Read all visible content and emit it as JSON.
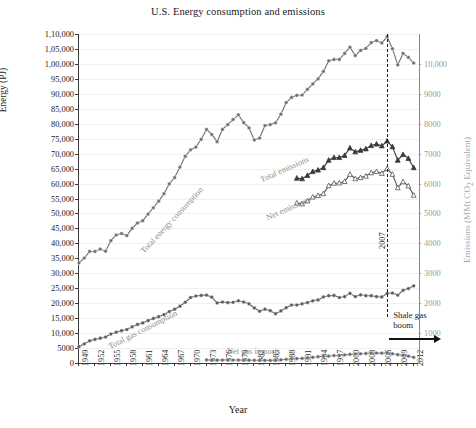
{
  "chart_data": {
    "type": "line",
    "title": "U.S. Energy consumption and emissions",
    "xlabel": "Year",
    "ylabel": "Energy (PJ)",
    "ylabel_right": "Emissions (MMt CO2 Equivalent)",
    "ylabel_right_parts": {
      "pre": "Emissions (MMt CO",
      "sub": "2",
      "post": " Equivalent)"
    },
    "xlim": [
      1949,
      2013
    ],
    "ylim": [
      0,
      110000
    ],
    "ylim_right": [
      0,
      11000
    ],
    "grid": true,
    "legend_position": "inline-annotations",
    "ytick_labels_left": [
      "0",
      "5000",
      "10,000",
      "15,000",
      "20,000",
      "25,000",
      "30,000",
      "35,000",
      "40,000",
      "45,000",
      "50,000",
      "55,000",
      "60,000",
      "65,000",
      "70,000",
      "75,000",
      "80,000",
      "85,000",
      "90,000",
      "95,000",
      "1,00,000",
      "1,05,000",
      "1,10,000"
    ],
    "ytick_values_left": [
      0,
      5000,
      10000,
      15000,
      20000,
      25000,
      30000,
      35000,
      40000,
      45000,
      50000,
      55000,
      60000,
      65000,
      70000,
      75000,
      80000,
      85000,
      90000,
      95000,
      100000,
      105000,
      110000
    ],
    "ytick_labels_right": [
      "1000",
      "2000",
      "3000",
      "4000",
      "5000",
      "6000",
      "7000",
      "8000",
      "9000",
      "10,000"
    ],
    "ytick_values_right": [
      1000,
      2000,
      3000,
      4000,
      5000,
      6000,
      7000,
      8000,
      9000,
      10000
    ],
    "xtick_labels": [
      "1949",
      "1952",
      "1955",
      "1958",
      "1961",
      "1964",
      "1967",
      "1970",
      "1973",
      "1976",
      "1979",
      "1982",
      "1985",
      "1988",
      "1991",
      "1994",
      "1997",
      "2000",
      "2003",
      "2006",
      "2009",
      "2012"
    ],
    "xtick_values": [
      1949,
      1952,
      1955,
      1958,
      1961,
      1964,
      1967,
      1970,
      1973,
      1976,
      1979,
      1982,
      1985,
      1988,
      1991,
      1994,
      1997,
      2000,
      2003,
      2006,
      2009,
      2012
    ],
    "annotations": [
      {
        "name": "event-line-2007",
        "label": "2007",
        "x": 2007,
        "style": "dashed-vertical"
      },
      {
        "name": "shale-gas-boom",
        "label_line1": "Shale gas",
        "label_line2": "boom",
        "x": 2007,
        "style": "arrow-right"
      }
    ],
    "series": [
      {
        "name": "Total energy consumption",
        "axis": "left",
        "marker": "circle",
        "color": "#6f6f6f",
        "x": [
          1949,
          1950,
          1951,
          1952,
          1953,
          1954,
          1955,
          1956,
          1957,
          1958,
          1959,
          1960,
          1961,
          1962,
          1963,
          1964,
          1965,
          1966,
          1967,
          1968,
          1969,
          1970,
          1971,
          1972,
          1973,
          1974,
          1975,
          1976,
          1977,
          1978,
          1979,
          1980,
          1981,
          1982,
          1983,
          1984,
          1985,
          1986,
          1987,
          1988,
          1989,
          1990,
          1991,
          1992,
          1993,
          1994,
          1995,
          1996,
          1997,
          1998,
          1999,
          2000,
          2001,
          2002,
          2003,
          2004,
          2005,
          2006,
          2007,
          2008,
          2009,
          2010,
          2011,
          2012
        ],
        "values": [
          33500,
          35100,
          37300,
          37300,
          38100,
          37400,
          40900,
          42800,
          43300,
          42600,
          45000,
          46800,
          47600,
          49800,
          51900,
          54100,
          56600,
          59900,
          62000,
          65500,
          69100,
          71300,
          72200,
          74800,
          78100,
          76400,
          74000,
          78100,
          79700,
          81400,
          83000,
          80400,
          78600,
          74600,
          75200,
          79400,
          79700,
          80300,
          83200,
          87100,
          88800,
          89500,
          89600,
          91500,
          93300,
          95000,
          97500,
          101000,
          101500,
          101500,
          103500,
          105600,
          102800,
          104500,
          105200,
          107100,
          107800,
          107000,
          109100,
          105100,
          99700,
          103500,
          102200,
          100300
        ]
      },
      {
        "name": "Total gas consumption",
        "axis": "left",
        "marker": "circle",
        "color": "#595959",
        "x": [
          1949,
          1950,
          1951,
          1952,
          1953,
          1954,
          1955,
          1956,
          1957,
          1958,
          1959,
          1960,
          1961,
          1962,
          1963,
          1964,
          1965,
          1966,
          1967,
          1968,
          1969,
          1970,
          1971,
          1972,
          1973,
          1974,
          1975,
          1976,
          1977,
          1978,
          1979,
          1980,
          1981,
          1982,
          1983,
          1984,
          1985,
          1986,
          1987,
          1988,
          1989,
          1990,
          1991,
          1992,
          1993,
          1994,
          1995,
          1996,
          1997,
          1998,
          1999,
          2000,
          2001,
          2002,
          2003,
          2004,
          2005,
          2006,
          2007,
          2008,
          2009,
          2010,
          2011,
          2012
        ],
        "values": [
          5500,
          6400,
          7400,
          7900,
          8300,
          8700,
          9700,
          10300,
          10800,
          11200,
          12100,
          12900,
          13400,
          14200,
          14900,
          15500,
          16200,
          17200,
          18000,
          19000,
          20300,
          21900,
          22400,
          22600,
          22700,
          22000,
          20100,
          20400,
          20200,
          20300,
          20800,
          20400,
          19800,
          18400,
          17300,
          18000,
          17500,
          16500,
          17400,
          18500,
          19400,
          19400,
          19800,
          20200,
          20800,
          21100,
          22100,
          22500,
          22600,
          21900,
          22200,
          23300,
          22200,
          22800,
          22500,
          22500,
          22200,
          22100,
          23300,
          23400,
          22700,
          24300,
          24900,
          25800
        ]
      },
      {
        "name": "Net gas imports",
        "axis": "left",
        "marker": "circle",
        "color": "#6a6a6a",
        "x": [
          1973,
          1974,
          1975,
          1976,
          1977,
          1978,
          1979,
          1980,
          1981,
          1982,
          1983,
          1984,
          1985,
          1986,
          1987,
          1988,
          1989,
          1990,
          1991,
          1992,
          1993,
          1994,
          1995,
          1996,
          1997,
          1998,
          1999,
          2000,
          2001,
          2002,
          2003,
          2004,
          2005,
          2006,
          2007,
          2008,
          2009,
          2010,
          2011,
          2012
        ],
        "values": [
          1050,
          950,
          960,
          980,
          1050,
          1000,
          1000,
          960,
          930,
          930,
          900,
          880,
          870,
          900,
          1050,
          1250,
          1400,
          1480,
          1550,
          1700,
          1900,
          2100,
          2200,
          2300,
          2500,
          2550,
          2700,
          2900,
          3000,
          3100,
          3200,
          3300,
          3350,
          3300,
          3450,
          3100,
          2800,
          2600,
          2300,
          1900
        ]
      },
      {
        "name": "Total emissions",
        "axis": "right",
        "marker": "triangle-filled",
        "color": "#3a3a3a",
        "x": [
          1990,
          1991,
          1992,
          1993,
          1994,
          1995,
          1996,
          1997,
          1998,
          1999,
          2000,
          2001,
          2002,
          2003,
          2004,
          2005,
          2006,
          2007,
          2008,
          2009,
          2010,
          2011,
          2012
        ],
        "values": [
          6180,
          6160,
          6270,
          6400,
          6450,
          6530,
          6780,
          6870,
          6870,
          6940,
          7190,
          7060,
          7110,
          7160,
          7270,
          7320,
          7260,
          7420,
          7230,
          6780,
          6970,
          6840,
          6530
        ]
      },
      {
        "name": "Net emissions",
        "axis": "right",
        "marker": "triangle-open",
        "color": "#555555",
        "x": [
          1990,
          1991,
          1992,
          1993,
          1994,
          1995,
          1996,
          1997,
          1998,
          1999,
          2000,
          2001,
          2002,
          2003,
          2004,
          2005,
          2006,
          2007,
          2008,
          2009,
          2010,
          2011,
          2012
        ],
        "values": [
          5350,
          5320,
          5420,
          5550,
          5600,
          5660,
          5930,
          6010,
          6020,
          6070,
          6310,
          6160,
          6200,
          6250,
          6360,
          6400,
          6340,
          6500,
          6310,
          5860,
          6060,
          5920,
          5610
        ]
      }
    ]
  },
  "inline_labels": [
    {
      "name": "label-total-energy-consumption",
      "text": "Total energy consumption"
    },
    {
      "name": "label-total-gas-consumption",
      "text": "Total gas consumption"
    },
    {
      "name": "label-net-gas-imports",
      "text": "Net gas imports"
    },
    {
      "name": "label-total-emissions",
      "text": "Total emissions"
    },
    {
      "name": "label-net-emissions",
      "text": "Net emissions"
    }
  ]
}
